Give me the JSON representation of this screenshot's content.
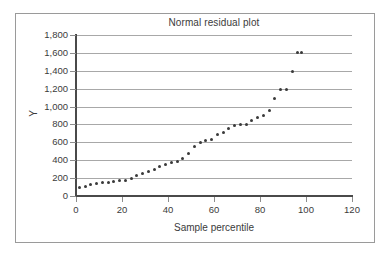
{
  "chart_data": {
    "type": "scatter",
    "title": "Normal residual plot",
    "xlabel": "Sample percentile",
    "ylabel": "Y",
    "xlim": [
      0,
      120
    ],
    "ylim": [
      0,
      1800
    ],
    "xticks": [
      0,
      20,
      40,
      60,
      80,
      100,
      120
    ],
    "yticks": [
      0,
      200,
      400,
      600,
      800,
      1000,
      1200,
      1400,
      1600,
      1800
    ],
    "xtick_labels": [
      "0",
      "20",
      "40",
      "60",
      "80",
      "100",
      "120"
    ],
    "ytick_labels": [
      "0",
      "200",
      "400",
      "600",
      "800",
      "1,000",
      "1,200",
      "1,400",
      "1,600",
      "1,800"
    ],
    "grid": "horizontal",
    "legend": "none",
    "marker_color": "#3a3a3a",
    "marker_size": 3,
    "series": [
      {
        "name": "Y",
        "x": [
          1.5,
          4.0,
          6.5,
          9.0,
          11.5,
          14.0,
          16.5,
          19.0,
          21.5,
          24.0,
          26.5,
          29.0,
          31.5,
          34.0,
          36.5,
          39.0,
          41.5,
          44.0,
          46.5,
          49.0,
          51.5,
          54.0,
          56.5,
          59.0,
          61.5,
          64.0,
          66.5,
          69.0,
          71.5,
          74.0,
          76.5,
          79.0,
          81.5,
          84.0,
          86.5,
          89.0,
          91.5,
          94.0,
          96.5,
          98.0
        ],
        "y": [
          95,
          110,
          125,
          135,
          148,
          152,
          160,
          170,
          175,
          195,
          230,
          255,
          275,
          300,
          330,
          355,
          375,
          385,
          420,
          475,
          550,
          600,
          620,
          635,
          685,
          715,
          750,
          785,
          795,
          800,
          845,
          880,
          900,
          960,
          1090,
          1195,
          1195,
          1395,
          1600,
          1600
        ]
      }
    ]
  },
  "figure": {
    "background": "#ffffff",
    "frame_color": "#9a9a9a",
    "axis_color": "#4a4a4a",
    "grid_color": "#a8a8a8"
  }
}
